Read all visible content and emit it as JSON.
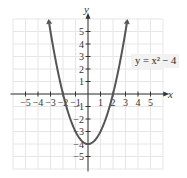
{
  "chart_data": {
    "type": "line",
    "title": "",
    "equation": "y = x² − 4",
    "xlabel": "x",
    "ylabel": "y",
    "xlim": [
      -6,
      6
    ],
    "ylim": [
      -6,
      6
    ],
    "grid": true,
    "x_ticks": [
      -5,
      -4,
      -3,
      -2,
      -1,
      1,
      2,
      3,
      4,
      5
    ],
    "y_ticks": [
      -5,
      -4,
      -3,
      -2,
      -1,
      1,
      2,
      3,
      4,
      5
    ],
    "series": [
      {
        "name": "y = x^2 - 4",
        "x": [
          -3.1,
          -3,
          -2.5,
          -2,
          -1.5,
          -1,
          -0.5,
          0,
          0.5,
          1,
          1.5,
          2,
          2.5,
          3,
          3.1
        ],
        "y": [
          5.61,
          5,
          2.25,
          0,
          -1.75,
          -3,
          -3.75,
          -4,
          -3.75,
          -3,
          -1.75,
          0,
          2.25,
          5,
          5.61
        ]
      }
    ],
    "annotations": [
      {
        "text": "y = x² − 4",
        "x": 4.4,
        "y": 3
      }
    ],
    "colors": {
      "curve": "#555555",
      "axis": "#333333",
      "grid": "#e6e6e6"
    }
  },
  "labels": {
    "x_axis": "x",
    "y_axis": "y",
    "equation_label": "y = x² − 4"
  }
}
